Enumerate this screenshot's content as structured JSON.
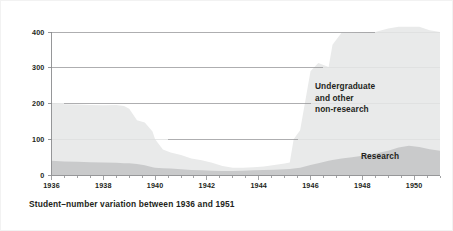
{
  "caption": "Student–number variation between 1936 and 1951",
  "colors": {
    "background": "#ffffff",
    "undergraduate_fill": "#e9eaea",
    "research_fill": "#c9cacb",
    "axis": "#8b8c8e",
    "gridline": "#8b8c8e",
    "text": "#231f20"
  },
  "chart_data": {
    "type": "area",
    "stacked": true,
    "title": "",
    "subtitle": "",
    "xlabel": "",
    "ylabel": "",
    "xlim": [
      1936,
      1951
    ],
    "ylim": [
      0,
      400
    ],
    "grid": true,
    "gridlines": [
      100,
      200,
      300,
      400
    ],
    "legend_position": "inline-annotation",
    "y_ticks": [
      0,
      100,
      200,
      300,
      400
    ],
    "y_tick_labels": [
      "0",
      "100",
      "200",
      "300",
      "400"
    ],
    "x_ticks": [
      1936,
      1938,
      1940,
      1942,
      1944,
      1946,
      1948,
      1950
    ],
    "x_tick_labels": [
      "1936",
      "1938",
      "1940",
      "1942",
      "1944",
      "1946",
      "1948",
      "1950"
    ],
    "x_minor_tick_interval": 0.5,
    "x": [
      1936.0,
      1936.5,
      1937.0,
      1937.5,
      1938.0,
      1938.5,
      1938.8,
      1939.0,
      1939.3,
      1939.6,
      1939.9,
      1940.0,
      1940.3,
      1940.6,
      1941.0,
      1941.4,
      1941.8,
      1942.2,
      1942.6,
      1943.0,
      1943.4,
      1943.8,
      1944.2,
      1944.6,
      1945.0,
      1945.2,
      1945.35,
      1945.6,
      1946.0,
      1946.3,
      1946.7,
      1946.85,
      1947.2,
      1947.6,
      1948.0,
      1948.5,
      1949.0,
      1949.4,
      1949.8,
      1950.2,
      1950.6,
      1951.0
    ],
    "series": [
      {
        "name": "Research",
        "label": "Research",
        "color": "#c9cacb",
        "values": [
          40,
          38,
          37,
          36,
          35,
          34,
          33,
          33,
          31,
          27,
          22,
          20,
          19,
          18,
          16,
          14,
          13,
          12,
          11,
          11,
          12,
          13,
          14,
          15,
          16,
          17,
          18,
          20,
          28,
          33,
          40,
          42,
          46,
          50,
          54,
          60,
          68,
          77,
          82,
          78,
          72,
          68
        ]
      },
      {
        "name": "Undergraduate and other non-research",
        "label": "Undergraduate\nand other\nnon-research",
        "color": "#e9eaea",
        "values": [
          162,
          160,
          160,
          160,
          160,
          162,
          160,
          152,
          122,
          120,
          100,
          80,
          52,
          45,
          40,
          32,
          28,
          22,
          14,
          9,
          8,
          9,
          10,
          13,
          16,
          18,
          82,
          105,
          262,
          280,
          262,
          322,
          352,
          348,
          345,
          340,
          342,
          338,
          333,
          337,
          333,
          332
        ]
      }
    ],
    "totals_note": "Research series drawn at the base; undergraduate/other non-research stacked above it."
  },
  "annotations": {
    "undergraduate": {
      "line1": "Undergraduate",
      "line2": "and other",
      "line3": "non-research"
    },
    "research": {
      "line1": "Research"
    }
  }
}
